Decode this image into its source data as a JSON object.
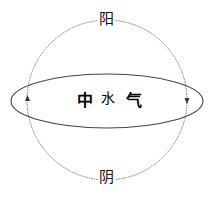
{
  "diagram": {
    "top_label": "阳",
    "bottom_label": "阴",
    "center_chars": [
      "中",
      "水",
      "气"
    ],
    "colors": {
      "line": "#555555",
      "text": "#111111",
      "background": "#ffffff"
    },
    "arrows": {
      "left": "up-arrow",
      "right": "down-arrow"
    }
  }
}
